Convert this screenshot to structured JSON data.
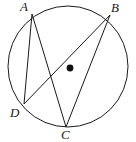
{
  "figure": {
    "background_color": "#ffffff",
    "stroke_color": "#1a1a1a",
    "label_color": "#1a1a1a",
    "circle": {
      "name": "circle-outline",
      "center_x": 68,
      "center_y": 66.5,
      "radius_x": 60,
      "radius_y": 60.5,
      "stroke_width": 1
    },
    "center_point": {
      "name": "center-dot",
      "x": 70,
      "y": 68,
      "radius": 3.4,
      "fill": "#111111"
    },
    "points": [
      {
        "id": "A",
        "label": "A",
        "x": 32,
        "y": 14,
        "label_x": 20,
        "label_y": 0
      },
      {
        "id": "B",
        "label": "B",
        "x": 110,
        "y": 15,
        "label_x": 111,
        "label_y": 1
      },
      {
        "id": "C",
        "label": "C",
        "x": 66,
        "y": 127,
        "label_x": 61,
        "label_y": 128
      },
      {
        "id": "D",
        "label": "D",
        "x": 24,
        "y": 104,
        "label_x": 10,
        "label_y": 106
      }
    ],
    "chords": [
      {
        "name": "chord-AD",
        "from": "A",
        "to": "D",
        "x1": 32,
        "y1": 14,
        "x2": 24,
        "y2": 104
      },
      {
        "name": "chord-AC",
        "from": "A",
        "to": "C",
        "x1": 32,
        "y1": 14,
        "x2": 66,
        "y2": 127
      },
      {
        "name": "chord-DB",
        "from": "D",
        "to": "B",
        "x1": 24,
        "y1": 104,
        "x2": 110,
        "y2": 15
      },
      {
        "name": "chord-BC",
        "from": "B",
        "to": "C",
        "x1": 110,
        "y1": 15,
        "x2": 66,
        "y2": 127
      }
    ]
  }
}
